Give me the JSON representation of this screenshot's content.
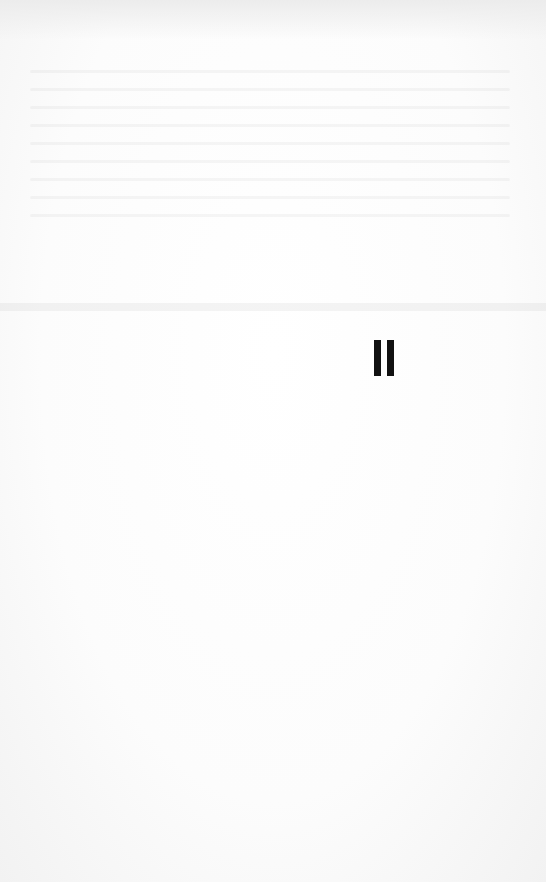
{
  "page": {
    "mark": "II",
    "mark_color": "#111111",
    "background": "#fbfbfb"
  }
}
